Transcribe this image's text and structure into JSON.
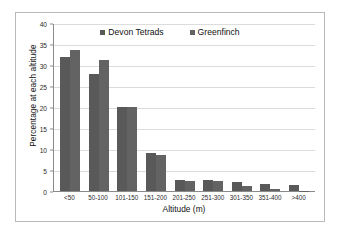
{
  "chart_data": {
    "type": "bar",
    "title": "",
    "xlabel": "Altitude (m)",
    "ylabel": "Percentage at each altitude",
    "ylim": [
      0,
      40
    ],
    "yticks": [
      0,
      5,
      10,
      15,
      20,
      25,
      30,
      35,
      40
    ],
    "grid": true,
    "legend_position": "top-center",
    "categories": [
      "<50",
      "50-100",
      "101-150",
      "151-200",
      "201-250",
      "251-300",
      "301-350",
      "351-400",
      ">400"
    ],
    "series": [
      {
        "name": "Devon Tetrads",
        "color": "#595959",
        "values": [
          32.0,
          27.8,
          20.0,
          9.0,
          2.6,
          2.7,
          2.1,
          1.7,
          1.4
        ]
      },
      {
        "name": "Greenfinch",
        "color": "#636363",
        "values": [
          33.5,
          31.2,
          19.9,
          8.5,
          2.4,
          2.3,
          1.2,
          0.5,
          0.1
        ]
      }
    ]
  }
}
